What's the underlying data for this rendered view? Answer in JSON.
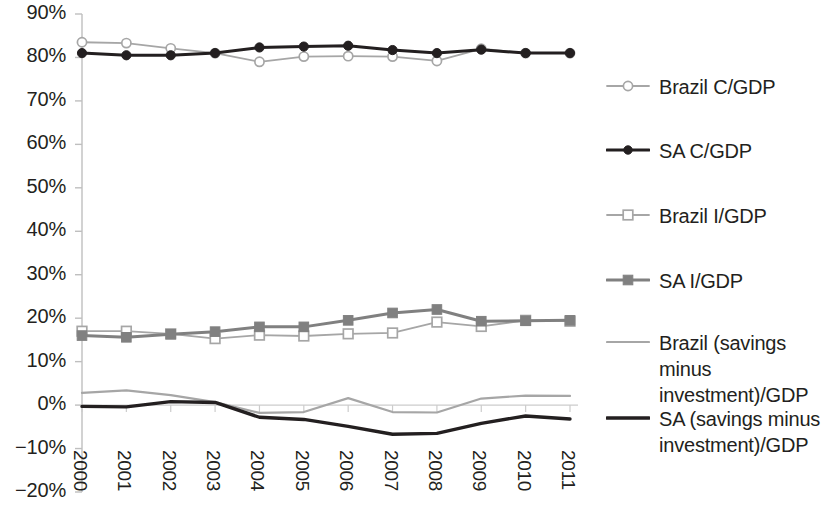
{
  "chart_data": {
    "type": "line",
    "title": "",
    "subtitle": "",
    "xlabel": "",
    "ylabel": "",
    "grid": false,
    "legend_position": "right",
    "categories": [
      "2000",
      "2001",
      "2002",
      "2003",
      "2004",
      "2005",
      "2006",
      "2007",
      "2008",
      "2009",
      "2010",
      "2011"
    ],
    "ylim": [
      -20,
      90
    ],
    "ytick_labels": [
      "90%",
      "80%",
      "70%",
      "60%",
      "50%",
      "40%",
      "30%",
      "20%",
      "10%",
      "0%",
      "−10%",
      "−20%"
    ],
    "ytick_values": [
      90,
      80,
      70,
      60,
      50,
      40,
      30,
      20,
      10,
      0,
      -10,
      -20
    ],
    "series": [
      {
        "name": "Brazil C/GDP",
        "color": "#a6a6a6",
        "marker": "circle-open",
        "values": [
          83.5,
          83.3,
          82.1,
          81.0,
          79.0,
          80.2,
          80.3,
          80.2,
          79.2,
          82.0,
          81.0,
          81.0
        ]
      },
      {
        "name": "SA C/GDP",
        "color": "#231f20",
        "marker": "circle-filled",
        "values": [
          81.0,
          80.5,
          80.5,
          81.0,
          82.3,
          82.5,
          82.7,
          81.7,
          81.0,
          81.8,
          81.0,
          81.0
        ]
      },
      {
        "name": "Brazil I/GDP",
        "color": "#a6a6a6",
        "marker": "square-open",
        "values": [
          17.0,
          17.0,
          16.4,
          15.3,
          16.1,
          15.9,
          16.4,
          16.6,
          19.1,
          18.1,
          19.5,
          19.3
        ]
      },
      {
        "name": "SA I/GDP",
        "color": "#808080",
        "marker": "square-filled",
        "values": [
          16.0,
          15.6,
          16.3,
          16.9,
          18.0,
          18.0,
          19.5,
          21.2,
          22.0,
          19.3,
          19.4,
          19.5
        ]
      },
      {
        "name": "Brazil (savings minus investment)/GDP",
        "color": "#a6a6a6",
        "marker": "none",
        "values": [
          2.8,
          3.4,
          2.3,
          0.7,
          -1.8,
          -1.6,
          1.6,
          -1.6,
          -1.7,
          1.5,
          2.2,
          2.1
        ]
      },
      {
        "name": "SA (savings minus investment)/GDP",
        "color": "#231f20",
        "marker": "none",
        "values": [
          -0.3,
          -0.4,
          0.8,
          0.6,
          -2.8,
          -3.3,
          -4.9,
          -6.7,
          -6.5,
          -4.2,
          -2.5,
          -3.2
        ]
      }
    ]
  },
  "legend": {
    "items": [
      {
        "label": "Brazil C/GDP",
        "marker": "circle-open-marker",
        "color": "#a6a6a6"
      },
      {
        "label": "SA C/GDP",
        "marker": "circle-filled-marker",
        "color": "#231f20"
      },
      {
        "label": "Brazil I/GDP",
        "marker": "square-open-marker",
        "color": "#a6a6a6"
      },
      {
        "label": "SA I/GDP",
        "marker": "square-filled-marker",
        "color": "#808080"
      },
      {
        "label": "Brazil (savings minus\ninvestment)/GDP",
        "marker": "line-light-marker",
        "color": "#a6a6a6"
      },
      {
        "label": "SA (savings minus\ninvestment)/GDP",
        "marker": "line-dark-marker",
        "color": "#231f20"
      }
    ]
  }
}
